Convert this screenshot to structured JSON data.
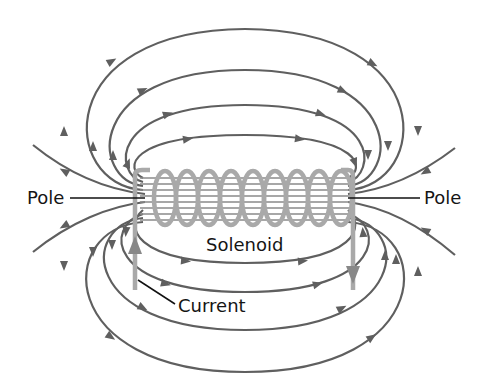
{
  "diagram": {
    "labels": {
      "pole_left": "Pole",
      "pole_right": "Pole",
      "solenoid": "Solenoid",
      "current": "Current"
    },
    "elements": {
      "coil_turns": 9,
      "field_lines_top": 4,
      "field_lines_bottom": 4,
      "open_field_lines_per_side": 2,
      "current_direction_left": "up",
      "current_direction_right": "down"
    },
    "colors": {
      "field_line": "#5f5f5f",
      "coil": "#a9a9a9",
      "text": "#151515",
      "background": "#ffffff"
    }
  }
}
